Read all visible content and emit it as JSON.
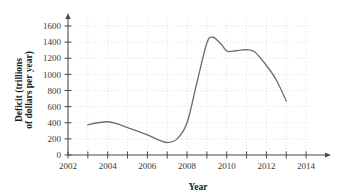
{
  "chart_data": {
    "type": "line",
    "title": "",
    "xlabel": "Year",
    "ylabel": "Deficit (trillions of dollars per year)",
    "ylabel_line1": "Deficit (trillions",
    "ylabel_line2": "of dollars per year)",
    "xlim": [
      2002,
      2014.6
    ],
    "ylim": [
      0,
      1700
    ],
    "grid": true,
    "legend": "none",
    "x_major_ticks": [
      2002,
      2004,
      2006,
      2008,
      2010,
      2012,
      2014
    ],
    "x_minor_ticks": [
      2003,
      2005,
      2007,
      2009,
      2011,
      2013
    ],
    "x_tick_labels": [
      "2002",
      "2004",
      "2006",
      "2008",
      "2010",
      "2012",
      "2014"
    ],
    "y_ticks": [
      0,
      200,
      400,
      600,
      800,
      1000,
      1200,
      1400,
      1600
    ],
    "y_tick_labels": [
      "0",
      "200",
      "400",
      "600",
      "800",
      "1000",
      "1200",
      "1400",
      "1600"
    ],
    "line_color": "#6e6e6e",
    "grid_color": "#cfcfcf",
    "axis_color": "#4a4a4a",
    "x": [
      2003.0,
      2003.5,
      2004.0,
      2004.5,
      2005.0,
      2005.5,
      2006.0,
      2006.5,
      2007.0,
      2007.5,
      2008.0,
      2008.5,
      2009.0,
      2009.3,
      2009.7,
      2010.0,
      2010.3,
      2010.7,
      2011.0,
      2011.4,
      2012.0,
      2012.5,
      2013.0
    ],
    "values": [
      375,
      400,
      412,
      385,
      340,
      295,
      250,
      195,
      155,
      200,
      400,
      900,
      1390,
      1460,
      1380,
      1290,
      1288,
      1300,
      1305,
      1280,
      1110,
      930,
      670
    ],
    "series": [
      {
        "name": "Deficit",
        "values": [
          375,
          400,
          412,
          385,
          340,
          295,
          250,
          195,
          155,
          200,
          400,
          900,
          1390,
          1460,
          1380,
          1290,
          1288,
          1300,
          1305,
          1280,
          1110,
          930,
          670
        ]
      }
    ]
  }
}
